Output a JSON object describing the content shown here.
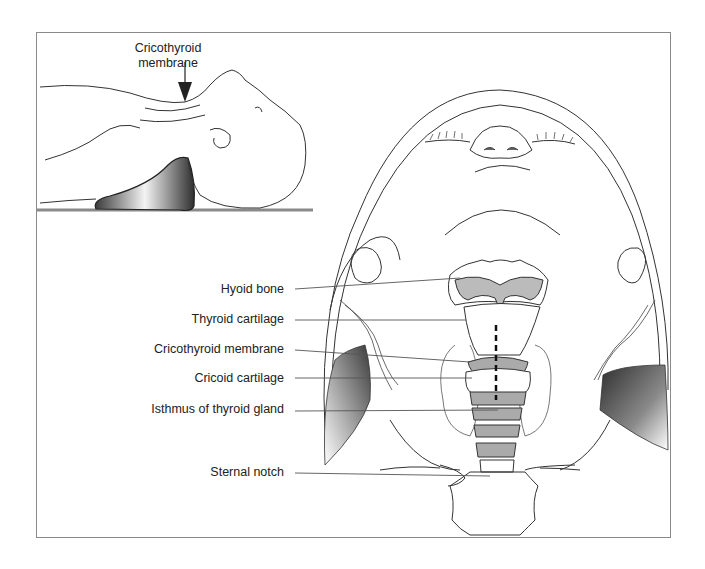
{
  "inset": {
    "label_line1": "Cricothyroid",
    "label_line2": "membrane"
  },
  "labels": [
    {
      "id": "hyoid",
      "text": "Hyoid bone"
    },
    {
      "id": "thyroid",
      "text": "Thyroid cartilage"
    },
    {
      "id": "cricothyroid",
      "text": "Cricothyroid membrane"
    },
    {
      "id": "cricoid",
      "text": "Cricoid cartilage"
    },
    {
      "id": "isthmus",
      "text": "Isthmus of thyroid gland"
    },
    {
      "id": "sternal",
      "text": "Sternal notch"
    }
  ],
  "colors": {
    "line": "#333333",
    "frame": "#8a8a8a",
    "shade_dark": "#3a3a3a",
    "shade_light": "#f0f0f0"
  }
}
